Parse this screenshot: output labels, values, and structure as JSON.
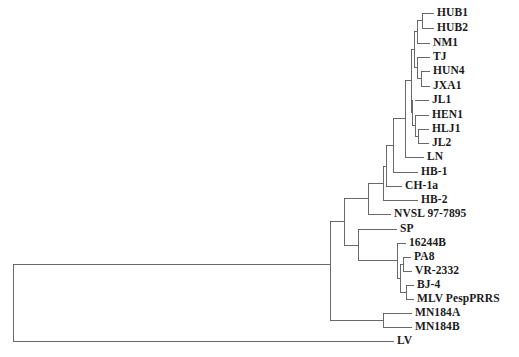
{
  "figure": {
    "name": "phylogenetic-tree",
    "type": "rectangular-cladogram",
    "width": 519,
    "height": 357,
    "background_color": "#ffffff",
    "line_color": "#59595b",
    "label_color": "#1b1b1b"
  },
  "taxa": [
    {
      "id": "HUB1",
      "label": "HUB1",
      "y": 13,
      "tip_x": 434
    },
    {
      "id": "HUB2",
      "label": "HUB2",
      "y": 28,
      "tip_x": 434
    },
    {
      "id": "NM1",
      "label": "NM1",
      "y": 43,
      "tip_x": 430
    },
    {
      "id": "TJ",
      "label": "TJ",
      "y": 57,
      "tip_x": 430
    },
    {
      "id": "HUN4",
      "label": "HUN4",
      "y": 71,
      "tip_x": 430
    },
    {
      "id": "JXA1",
      "label": "JXA1",
      "y": 86,
      "tip_x": 430
    },
    {
      "id": "JL1",
      "label": "JL1",
      "y": 100,
      "tip_x": 429
    },
    {
      "id": "HEN1",
      "label": "HEN1",
      "y": 115,
      "tip_x": 429
    },
    {
      "id": "HLJ1",
      "label": "HLJ1",
      "y": 129,
      "tip_x": 429
    },
    {
      "id": "JL2",
      "label": "JL2",
      "y": 143,
      "tip_x": 429
    },
    {
      "id": "LN",
      "label": "LN",
      "y": 157,
      "tip_x": 424
    },
    {
      "id": "HB-1",
      "label": "HB-1",
      "y": 172,
      "tip_x": 418
    },
    {
      "id": "CH-1a",
      "label": "CH-1a",
      "y": 186,
      "tip_x": 402
    },
    {
      "id": "HB-2",
      "label": "HB-2",
      "y": 200,
      "tip_x": 418
    },
    {
      "id": "NVSL 97-7895",
      "label": "NVSL 97-7895",
      "y": 214,
      "tip_x": 391
    },
    {
      "id": "SP",
      "label": "SP",
      "y": 229,
      "tip_x": 397
    },
    {
      "id": "16244B",
      "label": "16244B",
      "y": 243,
      "tip_x": 406
    },
    {
      "id": "PA8",
      "label": "PA8",
      "y": 257,
      "tip_x": 411
    },
    {
      "id": "VR-2332",
      "label": "VR-2332",
      "y": 271,
      "tip_x": 412
    },
    {
      "id": "BJ-4",
      "label": "BJ-4",
      "y": 285,
      "tip_x": 414
    },
    {
      "id": "MLV PespPRRS",
      "label": "MLV PespPRRS",
      "y": 299,
      "tip_x": 414
    },
    {
      "id": "MN184A",
      "label": "MN184A",
      "y": 313,
      "tip_x": 412
    },
    {
      "id": "MN184B",
      "label": "MN184B",
      "y": 327,
      "tip_x": 412
    },
    {
      "id": "LV",
      "label": "LV",
      "y": 341,
      "tip_x": 394
    }
  ],
  "branches": [
    {
      "name": "tip-HUB1",
      "x1": 422,
      "y1": 13,
      "x2": 434,
      "y2": 13
    },
    {
      "name": "tip-HUB2",
      "x1": 422,
      "y1": 28,
      "x2": 434,
      "y2": 28
    },
    {
      "name": "node-HUB1-HUB2-v",
      "x1": 422,
      "y1": 13,
      "x2": 422,
      "y2": 28
    },
    {
      "name": "node-HUB1-HUB2-h",
      "x1": 417,
      "y1": 20,
      "x2": 422,
      "y2": 20
    },
    {
      "name": "tip-NM1",
      "x1": 417,
      "y1": 43,
      "x2": 430,
      "y2": 43
    },
    {
      "name": "node-hub-nm-v",
      "x1": 417,
      "y1": 20,
      "x2": 417,
      "y2": 43
    },
    {
      "name": "node-hub-nm-h",
      "x1": 414,
      "y1": 31,
      "x2": 417,
      "y2": 31
    },
    {
      "name": "tip-HUN4",
      "x1": 421,
      "y1": 71,
      "x2": 430,
      "y2": 71
    },
    {
      "name": "tip-JXA1",
      "x1": 421,
      "y1": 86,
      "x2": 430,
      "y2": 86
    },
    {
      "name": "node-hun-jxa-v",
      "x1": 421,
      "y1": 71,
      "x2": 421,
      "y2": 86
    },
    {
      "name": "node-hun-jxa-h",
      "x1": 417,
      "y1": 78,
      "x2": 421,
      "y2": 78
    },
    {
      "name": "tip-TJ",
      "x1": 417,
      "y1": 57,
      "x2": 430,
      "y2": 57
    },
    {
      "name": "node-tj-hunjxa-v",
      "x1": 417,
      "y1": 57,
      "x2": 417,
      "y2": 78
    },
    {
      "name": "node-tj-hunjxa-h",
      "x1": 414,
      "y1": 67,
      "x2": 417,
      "y2": 67
    },
    {
      "name": "node-upper6-v",
      "x1": 414,
      "y1": 31,
      "x2": 414,
      "y2": 67
    },
    {
      "name": "node-upper6-h",
      "x1": 411,
      "y1": 49,
      "x2": 414,
      "y2": 49
    },
    {
      "name": "tip-JL1",
      "x1": 415,
      "y1": 100,
      "x2": 429,
      "y2": 100
    },
    {
      "name": "tip-HEN1",
      "x1": 415,
      "y1": 115,
      "x2": 429,
      "y2": 115
    },
    {
      "name": "tip-HLJ1",
      "x1": 418,
      "y1": 129,
      "x2": 429,
      "y2": 129
    },
    {
      "name": "tip-JL2",
      "x1": 418,
      "y1": 143,
      "x2": 429,
      "y2": 143
    },
    {
      "name": "node-hlj-jl2-v",
      "x1": 418,
      "y1": 129,
      "x2": 418,
      "y2": 143
    },
    {
      "name": "node-hlj-jl2-h",
      "x1": 415,
      "y1": 136,
      "x2": 418,
      "y2": 136
    },
    {
      "name": "node-hen-hlj-v",
      "x1": 415,
      "y1": 115,
      "x2": 415,
      "y2": 136
    },
    {
      "name": "node-hen-hlj-h",
      "x1": 412,
      "y1": 125,
      "x2": 415,
      "y2": 125
    },
    {
      "name": "node-jl1-rest-v",
      "x1": 412,
      "y1": 100,
      "x2": 412,
      "y2": 125
    },
    {
      "name": "node-jl1-rest-h",
      "x1": 411,
      "y1": 112,
      "x2": 412,
      "y2": 112
    },
    {
      "name": "node-clade-a-v",
      "x1": 411,
      "y1": 49,
      "x2": 411,
      "y2": 112
    },
    {
      "name": "node-clade-a-h",
      "x1": 405,
      "y1": 80,
      "x2": 411,
      "y2": 80
    },
    {
      "name": "tip-LN",
      "x1": 405,
      "y1": 157,
      "x2": 424,
      "y2": 157
    },
    {
      "name": "node-clade-a-ln-v",
      "x1": 405,
      "y1": 80,
      "x2": 405,
      "y2": 157
    },
    {
      "name": "node-clade-a-ln-h",
      "x1": 393,
      "y1": 118,
      "x2": 405,
      "y2": 118
    },
    {
      "name": "tip-HB1",
      "x1": 393,
      "y1": 172,
      "x2": 418,
      "y2": 172
    },
    {
      "name": "node-hb1-clade-v",
      "x1": 393,
      "y1": 118,
      "x2": 393,
      "y2": 172
    },
    {
      "name": "node-hb1-clade-h",
      "x1": 386,
      "y1": 145,
      "x2": 393,
      "y2": 145
    },
    {
      "name": "tip-CH1a",
      "x1": 386,
      "y1": 186,
      "x2": 402,
      "y2": 186
    },
    {
      "name": "node-ch1a-v",
      "x1": 386,
      "y1": 145,
      "x2": 386,
      "y2": 186
    },
    {
      "name": "node-ch1a-h",
      "x1": 383,
      "y1": 166,
      "x2": 386,
      "y2": 166
    },
    {
      "name": "tip-HB2",
      "x1": 383,
      "y1": 200,
      "x2": 418,
      "y2": 200
    },
    {
      "name": "node-hb2-v",
      "x1": 383,
      "y1": 166,
      "x2": 383,
      "y2": 200
    },
    {
      "name": "node-hb2-h",
      "x1": 368,
      "y1": 183,
      "x2": 383,
      "y2": 183
    },
    {
      "name": "tip-NVSL",
      "x1": 368,
      "y1": 214,
      "x2": 391,
      "y2": 214
    },
    {
      "name": "node-nvsl-v",
      "x1": 368,
      "y1": 183,
      "x2": 368,
      "y2": 214
    },
    {
      "name": "node-nvsl-h",
      "x1": 344,
      "y1": 198,
      "x2": 368,
      "y2": 198
    },
    {
      "name": "tip-SP",
      "x1": 358,
      "y1": 229,
      "x2": 397,
      "y2": 229
    },
    {
      "name": "tip-16244B",
      "x1": 397,
      "y1": 243,
      "x2": 406,
      "y2": 243
    },
    {
      "name": "tip-PA8",
      "x1": 403,
      "y1": 257,
      "x2": 411,
      "y2": 257
    },
    {
      "name": "tip-VR2332",
      "x1": 403,
      "y1": 271,
      "x2": 412,
      "y2": 271
    },
    {
      "name": "node-pa8-vr-v",
      "x1": 403,
      "y1": 257,
      "x2": 403,
      "y2": 271
    },
    {
      "name": "node-pa8-vr-h",
      "x1": 400,
      "y1": 264,
      "x2": 403,
      "y2": 264
    },
    {
      "name": "tip-BJ4",
      "x1": 406,
      "y1": 285,
      "x2": 414,
      "y2": 285
    },
    {
      "name": "tip-MLV",
      "x1": 406,
      "y1": 299,
      "x2": 414,
      "y2": 299
    },
    {
      "name": "node-bj4-mlv-v",
      "x1": 406,
      "y1": 285,
      "x2": 406,
      "y2": 299
    },
    {
      "name": "node-bj4-mlv-h",
      "x1": 400,
      "y1": 292,
      "x2": 406,
      "y2": 292
    },
    {
      "name": "node-vacc-v",
      "x1": 400,
      "y1": 264,
      "x2": 400,
      "y2": 292
    },
    {
      "name": "node-vacc-h",
      "x1": 397,
      "y1": 278,
      "x2": 400,
      "y2": 278
    },
    {
      "name": "node-16244-v",
      "x1": 397,
      "y1": 243,
      "x2": 397,
      "y2": 278
    },
    {
      "name": "node-16244-h",
      "x1": 358,
      "y1": 260,
      "x2": 397,
      "y2": 260
    },
    {
      "name": "node-sp-v",
      "x1": 358,
      "y1": 229,
      "x2": 358,
      "y2": 260
    },
    {
      "name": "node-sp-h",
      "x1": 344,
      "y1": 245,
      "x2": 358,
      "y2": 245
    },
    {
      "name": "node-na-eu-v",
      "x1": 344,
      "y1": 198,
      "x2": 344,
      "y2": 245
    },
    {
      "name": "node-na-eu-h",
      "x1": 330,
      "y1": 221,
      "x2": 344,
      "y2": 221
    },
    {
      "name": "tip-MN184A",
      "x1": 383,
      "y1": 313,
      "x2": 412,
      "y2": 313
    },
    {
      "name": "tip-MN184B",
      "x1": 383,
      "y1": 327,
      "x2": 412,
      "y2": 327
    },
    {
      "name": "node-mn184-v",
      "x1": 383,
      "y1": 313,
      "x2": 383,
      "y2": 327
    },
    {
      "name": "node-mn184-h",
      "x1": 330,
      "y1": 320,
      "x2": 383,
      "y2": 320
    },
    {
      "name": "node-root-upper-v",
      "x1": 330,
      "y1": 221,
      "x2": 330,
      "y2": 320
    },
    {
      "name": "node-root-upper-h",
      "x1": 13,
      "y1": 264,
      "x2": 330,
      "y2": 264
    },
    {
      "name": "tip-LV",
      "x1": 13,
      "y1": 341,
      "x2": 394,
      "y2": 341
    },
    {
      "name": "root-v",
      "x1": 13,
      "y1": 264,
      "x2": 13,
      "y2": 341
    }
  ],
  "chart_data": {
    "type": "tree",
    "title": "",
    "tip_count": 24,
    "tip_labels": [
      "HUB1",
      "HUB2",
      "NM1",
      "TJ",
      "HUN4",
      "JXA1",
      "JL1",
      "HEN1",
      "HLJ1",
      "JL2",
      "LN",
      "HB-1",
      "CH-1a",
      "HB-2",
      "NVSL 97-7895",
      "SP",
      "16244B",
      "PA8",
      "VR-2332",
      "BJ-4",
      "MLV PespPRRS",
      "MN184A",
      "MN184B",
      "LV"
    ],
    "newick": "(((((((((((((HUB1,HUB2),NM1),(TJ,(HUN4,JXA1))),(JL1,(HEN1,(HLJ1,JL2)))),LN),HB-1),CH-1a),HB-2),NVSL 97-7895),(SP,(16244B,((PA8,VR-2332),(BJ-4,MLV PespPRRS))))),(MN184A,MN184B)),LV);",
    "clades": [
      {
        "name": "highly-pathogenic-chinese-cluster",
        "members": [
          "HUB1",
          "HUB2",
          "NM1",
          "TJ",
          "HUN4",
          "JXA1",
          "JL1",
          "HEN1",
          "HLJ1",
          "JL2"
        ]
      },
      {
        "name": "north-american-type-cluster",
        "members": [
          "LN",
          "HB-1",
          "CH-1a",
          "HB-2",
          "NVSL 97-7895",
          "SP",
          "16244B",
          "PA8",
          "VR-2332",
          "BJ-4",
          "MLV PespPRRS"
        ]
      },
      {
        "name": "mn184-cluster",
        "members": [
          "MN184A",
          "MN184B"
        ]
      },
      {
        "name": "outgroup",
        "members": [
          "LV"
        ]
      }
    ]
  }
}
